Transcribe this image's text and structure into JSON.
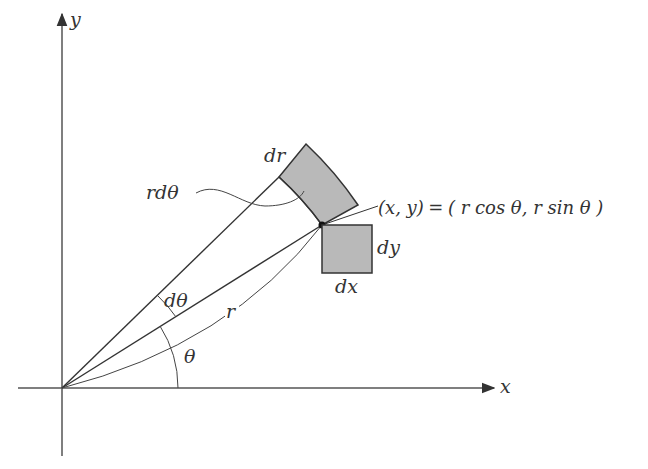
{
  "diagram": {
    "type": "polar-coordinate-area-element",
    "axes": {
      "x_label": "x",
      "y_label": "y",
      "origin": [
        62,
        388
      ]
    },
    "point": {
      "label": "(x,  y) = ( r cos θ,  r sin θ )",
      "label_parts": {
        "lhs": "(x,  y)",
        "eq": "=",
        "rhs": "( r cos θ,  r sin θ )"
      },
      "position": [
        322,
        225
      ]
    },
    "labels": {
      "dr": "dr",
      "rdtheta": "rdθ",
      "dtheta": "dθ",
      "r": "r",
      "theta": "θ",
      "dx": "dx",
      "dy": "dy"
    },
    "colors": {
      "fill": "#b9b9b9",
      "stroke": "#333333",
      "axis": "#555555",
      "background": "#ffffff"
    }
  }
}
